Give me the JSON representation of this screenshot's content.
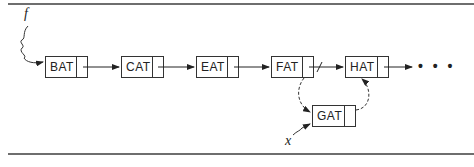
{
  "diagram": {
    "type": "linked-list-insertion",
    "head_pointer_label": "f",
    "new_node_pointer_label": "x",
    "nodes": [
      {
        "label": "BAT",
        "x": 45,
        "y": 56,
        "w": 43
      },
      {
        "label": "CAT",
        "x": 121,
        "y": 56,
        "w": 43
      },
      {
        "label": "EAT",
        "x": 196,
        "y": 56,
        "w": 43
      },
      {
        "label": "FAT",
        "x": 271,
        "y": 56,
        "w": 43
      },
      {
        "label": "HAT",
        "x": 345,
        "y": 56,
        "w": 44
      },
      {
        "label": "GAT",
        "x": 312,
        "y": 105,
        "w": 44
      }
    ],
    "continuation": "• • •",
    "edges": [
      {
        "from": "BAT",
        "to": "CAT",
        "style": "solid"
      },
      {
        "from": "CAT",
        "to": "EAT",
        "style": "solid"
      },
      {
        "from": "EAT",
        "to": "FAT",
        "style": "solid"
      },
      {
        "from": "FAT",
        "to": "HAT",
        "style": "solid-broken"
      },
      {
        "from": "HAT",
        "to": "continuation",
        "style": "solid"
      },
      {
        "from": "FAT",
        "to": "GAT",
        "style": "dashed"
      },
      {
        "from": "GAT",
        "to": "HAT",
        "style": "dashed"
      }
    ]
  }
}
